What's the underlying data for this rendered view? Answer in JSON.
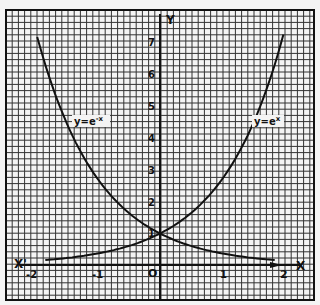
{
  "chart_data": {
    "type": "line",
    "title": "",
    "xlabel": "X",
    "xlabel_neg": "X'",
    "ylabel": "Y",
    "origin_label": "O",
    "x_ticks": [
      -2,
      -1,
      1,
      2
    ],
    "x_tick_labels": [
      "-2",
      "-1",
      "1",
      "2"
    ],
    "y_ticks": [
      1,
      2,
      3,
      4,
      5,
      6,
      7
    ],
    "y_tick_labels": [
      "1",
      "2",
      "3",
      "4",
      "5",
      "6",
      "7"
    ],
    "xlim": [
      -2.1,
      2.5
    ],
    "ylim": [
      -0.9,
      8.2
    ],
    "grid": true,
    "legend": "inline labels",
    "series": [
      {
        "name": "y = e^-x",
        "label": "y=e⁻ˣ",
        "x": [
          -1.9,
          -1.5,
          -1,
          -0.5,
          0,
          0.5,
          1,
          1.5,
          2
        ],
        "values": [
          6.69,
          4.48,
          2.72,
          1.65,
          1.0,
          0.61,
          0.37,
          0.22,
          0.14
        ]
      },
      {
        "name": "y = e^x",
        "label": "y=eˣ",
        "x": [
          -2,
          -1.5,
          -1,
          -0.5,
          0,
          0.5,
          1,
          1.5,
          1.95
        ],
        "values": [
          0.14,
          0.22,
          0.37,
          0.61,
          1.0,
          1.65,
          2.72,
          4.48,
          7.03
        ]
      }
    ]
  },
  "labels": {
    "y_axis": "Y",
    "x_axis": "X",
    "x_axis_neg": "X'",
    "origin": "O",
    "curve_left": "y=e",
    "curve_left_sup": "-x",
    "curve_right": "y=e",
    "curve_right_sup": "x"
  }
}
